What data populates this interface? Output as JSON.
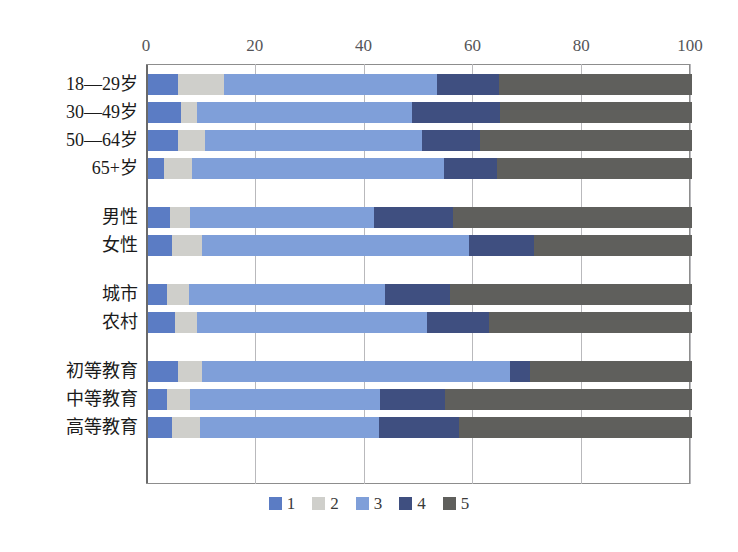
{
  "chart_data": {
    "type": "bar",
    "orientation": "horizontal",
    "stacked": true,
    "title": "",
    "xlabel": "",
    "ylabel": "",
    "xlim": [
      0,
      100
    ],
    "xticks": [
      0,
      20,
      40,
      60,
      80,
      100
    ],
    "grid": true,
    "legend_position": "bottom",
    "legend": [
      "1",
      "2",
      "3",
      "4",
      "5"
    ],
    "series_colors": [
      "#5b7cc4",
      "#cfcfcb",
      "#7f9fd9",
      "#3f4f80",
      "#5f5f5c"
    ],
    "categories": [
      "18—29岁",
      "30—49岁",
      "50—64岁",
      "65+岁",
      "男性",
      "女性",
      "城市",
      "农村",
      "初等教育",
      "中等教育",
      "高等教育"
    ],
    "group_breaks_after": [
      "65+岁",
      "女性",
      "农村"
    ],
    "series": [
      {
        "name": "1",
        "values": [
          5.5,
          6.0,
          5.5,
          3.0,
          4.0,
          4.5,
          3.5,
          5.0,
          5.6,
          3.5,
          4.5
        ]
      },
      {
        "name": "2",
        "values": [
          8.5,
          3.0,
          5.0,
          5.0,
          3.8,
          5.5,
          4.0,
          4.0,
          4.3,
          4.3,
          5.0
        ]
      },
      {
        "name": "3",
        "values": [
          39.1,
          39.5,
          39.9,
          46.4,
          33.7,
          49.0,
          36.1,
          42.3,
          56.6,
          34.9,
          33.0
        ]
      },
      {
        "name": "4",
        "values": [
          11.4,
          16.2,
          10.6,
          9.8,
          14.5,
          12.0,
          11.9,
          11.3,
          3.7,
          11.9,
          14.7
        ]
      },
      {
        "name": "5",
        "values": [
          35.5,
          35.3,
          39.0,
          35.8,
          44.0,
          29.0,
          44.5,
          37.4,
          29.8,
          45.4,
          42.8
        ]
      }
    ]
  },
  "axis": {
    "ticks": [
      "0",
      "20",
      "40",
      "60",
      "80",
      "100"
    ]
  }
}
